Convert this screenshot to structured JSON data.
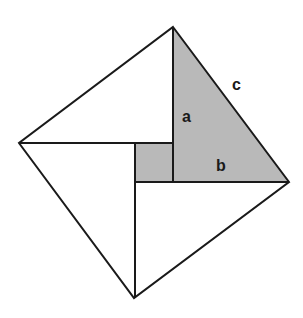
{
  "diagram": {
    "title": "",
    "colors": {
      "stroke": "#1a1a1a",
      "shade": "#b9b9b9",
      "background": "#ffffff"
    },
    "labels": {
      "a": "a",
      "b": "b",
      "c": "c"
    }
  }
}
